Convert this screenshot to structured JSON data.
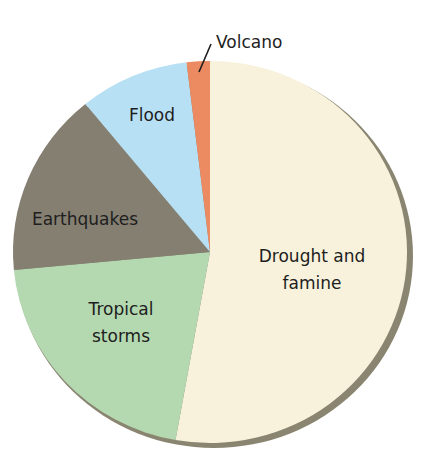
{
  "chart_data": {
    "type": "pie",
    "title": "",
    "start_angle_deg": 0,
    "direction": "clockwise",
    "categories": [
      "Drought and famine",
      "Tropical storms",
      "Earthquakes",
      "Flood",
      "Volcano"
    ],
    "values": [
      52.8,
      20.7,
      15.6,
      9.0,
      1.9
    ],
    "unit": "percent (estimated from slice angles)",
    "colors": [
      "#f8f2dc",
      "#b4d8b0",
      "#857f72",
      "#b8e0f4",
      "#ec8a62"
    ],
    "legend": "none (slices labelled directly)"
  },
  "labels": {
    "drought_line1": "Drought and",
    "drought_line2": "famine",
    "tropical_line1": "Tropical",
    "tropical_line2": "storms",
    "earthquakes": "Earthquakes",
    "flood": "Flood",
    "volcano": "Volcano"
  },
  "style": {
    "shadow_color": "#8a8570",
    "bottom_edge_green": "#5c9e6a"
  }
}
